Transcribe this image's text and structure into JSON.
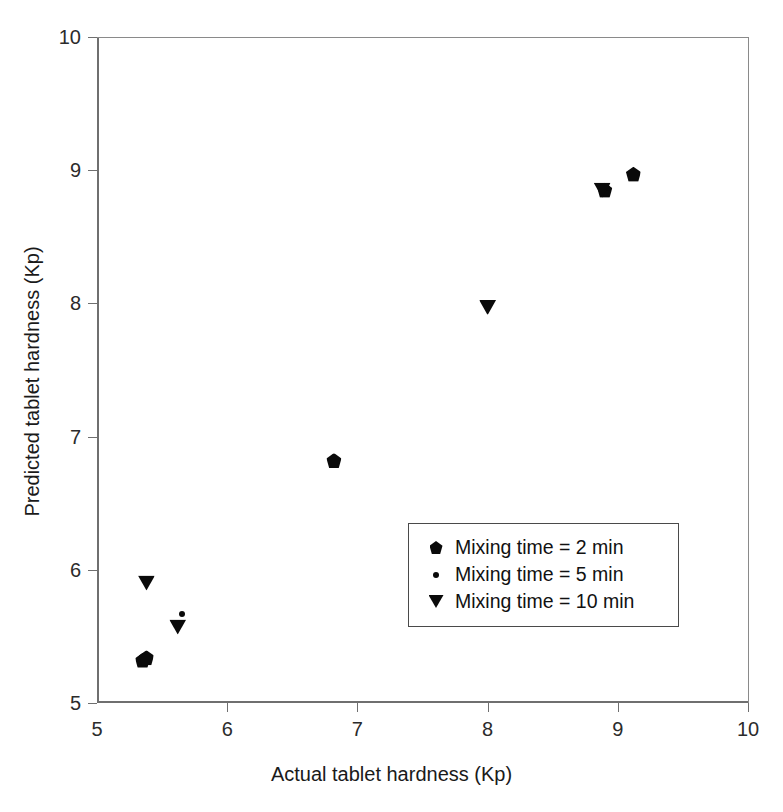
{
  "chart_data": {
    "type": "scatter",
    "title": "",
    "xlabel": "Actual tablet hardness (Kp)",
    "ylabel": "Predicted tablet hardness (Kp)",
    "xlim": [
      5,
      10
    ],
    "ylim": [
      5,
      10
    ],
    "xticks": [
      5,
      6,
      7,
      8,
      9,
      10
    ],
    "yticks": [
      5,
      6,
      7,
      8,
      9,
      10
    ],
    "xtick_labels": [
      "5",
      "6",
      "7",
      "8",
      "9",
      "10"
    ],
    "ytick_labels": [
      "5",
      "6",
      "7",
      "8",
      "9",
      "10"
    ],
    "grid": false,
    "legend_position": "center-right",
    "series": [
      {
        "name": "Mixing time = 2 min",
        "marker": "pentagon",
        "color": "#0a0a0a",
        "points": [
          {
            "x": 5.35,
            "y": 5.32
          },
          {
            "x": 5.38,
            "y": 5.34
          },
          {
            "x": 6.82,
            "y": 6.82
          },
          {
            "x": 8.9,
            "y": 8.85
          },
          {
            "x": 9.12,
            "y": 8.97
          }
        ]
      },
      {
        "name": "Mixing time = 5 min",
        "marker": "dot",
        "color": "#0a0a0a",
        "points": [
          {
            "x": 5.65,
            "y": 5.67
          },
          {
            "x": 8.0,
            "y": 7.98
          },
          {
            "x": 8.92,
            "y": 8.87
          }
        ]
      },
      {
        "name": "Mixing time = 10 min",
        "marker": "triangle-down",
        "color": "#0a0a0a",
        "points": [
          {
            "x": 5.38,
            "y": 5.9
          },
          {
            "x": 5.62,
            "y": 5.57
          },
          {
            "x": 8.0,
            "y": 7.97
          },
          {
            "x": 8.88,
            "y": 8.85
          }
        ]
      }
    ],
    "legend": [
      {
        "label": "Mixing time = 2 min",
        "marker": "pentagon"
      },
      {
        "label": "Mixing time = 5 min",
        "marker": "dot"
      },
      {
        "label": "Mixing time = 10 min",
        "marker": "triangle-down"
      }
    ]
  }
}
